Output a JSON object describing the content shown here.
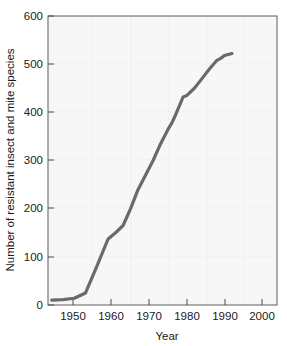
{
  "figure": {
    "background_color": "#ffffff",
    "plot_background_color": "#f7f7f7",
    "line_color": "#6a6a6a",
    "frame_color": "#5c5c5c",
    "text_color": "#1a1a1a"
  },
  "chart_data": {
    "type": "line",
    "title": "",
    "subtitle": "",
    "xlabel": "Year",
    "ylabel": "Number of resistant insect and mite species",
    "xlim": [
      1944,
      2005
    ],
    "ylim": [
      0,
      600
    ],
    "xticks": [
      1950,
      1960,
      1970,
      1980,
      1990,
      2000
    ],
    "xtick_labels": [
      "1950",
      "1960",
      "1970",
      "1980",
      "1990",
      "2000"
    ],
    "yticks": [
      0,
      100,
      200,
      300,
      400,
      500,
      600
    ],
    "ytick_labels": [
      "0",
      "100",
      "200",
      "300",
      "400",
      "500",
      "600"
    ],
    "grid": false,
    "legend": null,
    "legend_position": "none",
    "series": [
      {
        "name": "Resistant insect and mite species",
        "x": [
          1945,
          1948,
          1951,
          1954,
          1957,
          1960,
          1962,
          1964,
          1966,
          1968,
          1970,
          1972,
          1974,
          1976,
          1977,
          1978,
          1980,
          1981,
          1983,
          1985,
          1987,
          1989,
          1990,
          1991,
          1993
        ],
        "y": [
          10,
          11,
          14,
          25,
          80,
          137,
          150,
          165,
          200,
          240,
          270,
          300,
          335,
          365,
          378,
          395,
          432,
          435,
          450,
          470,
          490,
          508,
          512,
          518,
          522
        ]
      }
    ],
    "annotations": []
  },
  "axes": {
    "x_axis_name": "Year",
    "y_axis_name": "Number of resistant insect and mite species"
  }
}
